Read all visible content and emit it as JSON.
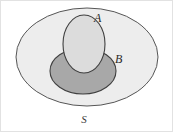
{
  "figure": {
    "kind": "venn-diagram",
    "caption_labels": {
      "universe": "S",
      "set_a": "A",
      "set_b": "B"
    },
    "colors": {
      "background": "#ffffff",
      "universe_fill": "#ededed",
      "set_a_fill": "#dcdcdc",
      "set_b_fill": "#a8a8a8",
      "stroke": "#4a4a4a",
      "frame": "#e2e2e2",
      "label_text": "#2b2b2b"
    },
    "shapes": {
      "universe_ellipse": {
        "cx": 86,
        "cy": 56,
        "rx": 71,
        "ry": 49
      },
      "set_a_ellipse": {
        "cx": 83,
        "cy": 43,
        "rx": 21,
        "ry": 29
      },
      "set_b_ellipse": {
        "cx": 82,
        "cy": 70,
        "rx": 33,
        "ry": 23
      }
    },
    "label_positions": {
      "set_a": {
        "x": 93,
        "y": 21
      },
      "set_b": {
        "x": 114,
        "y": 62
      },
      "universe": {
        "x": 83,
        "y": 122
      }
    }
  }
}
